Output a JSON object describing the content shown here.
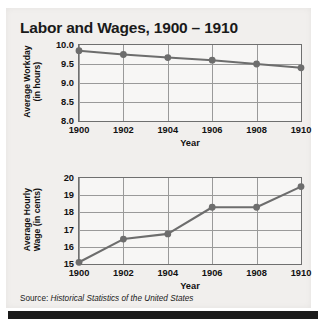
{
  "figure": {
    "title": "Labor and Wages, 1900 – 1910",
    "source_prefix": "Source: ",
    "source_title": "Historical Statistics of the United States",
    "accent_color": "#6f6f6f",
    "panel_color": "#f1efed",
    "plot_color": "#f7f6f5",
    "grid_color": "#9a9a9a",
    "marker_color": "#6d6d6d"
  },
  "chart_data": [
    {
      "type": "line",
      "title": "",
      "xlabel": "Year",
      "ylabel": "Average Workday\n(in hours)",
      "x": [
        1900,
        1902,
        1904,
        1906,
        1908,
        1910
      ],
      "xticklabels": [
        "1900",
        "1902",
        "1904",
        "1906",
        "1908",
        "1910"
      ],
      "values": [
        9.85,
        9.75,
        9.67,
        9.6,
        9.5,
        9.4
      ],
      "ylim": [
        8.0,
        10.0
      ],
      "yticks": [
        8.0,
        8.5,
        9.0,
        9.5,
        10.0
      ],
      "yticklabels": [
        "8.0",
        "8.5",
        "9.0",
        "9.5",
        "10.0"
      ],
      "xlim": [
        1900,
        1910
      ],
      "grid": true,
      "legend": "none"
    },
    {
      "type": "line",
      "title": "",
      "xlabel": "Year",
      "ylabel": "Average Hourly\nWage (in cents)",
      "x": [
        1900,
        1902,
        1904,
        1906,
        1908,
        1910
      ],
      "xticklabels": [
        "1900",
        "1902",
        "1904",
        "1906",
        "1908",
        "1910"
      ],
      "values": [
        15.1,
        16.45,
        16.75,
        18.3,
        18.3,
        19.5
      ],
      "ylim": [
        15,
        20
      ],
      "yticks": [
        15,
        16,
        17,
        18,
        19,
        20
      ],
      "yticklabels": [
        "15",
        "16",
        "17",
        "18",
        "19",
        "20"
      ],
      "xlim": [
        1900,
        1910
      ],
      "grid": true,
      "legend": "none"
    }
  ]
}
